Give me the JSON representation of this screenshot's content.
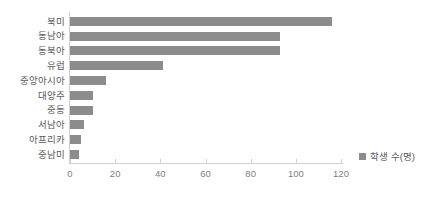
{
  "chart_data": {
    "type": "bar",
    "orientation": "horizontal",
    "title": "",
    "xlabel": "",
    "ylabel": "",
    "categories": [
      "북미",
      "동남아",
      "동북아",
      "유럽",
      "중앙아시아",
      "대양주",
      "중동",
      "서남아",
      "아프리카",
      "중남미"
    ],
    "series": [
      {
        "name": "학생 수(명)",
        "values": [
          116,
          93,
          93,
          41,
          16,
          10,
          10,
          6,
          5,
          4
        ],
        "color": "#8c8c8c"
      }
    ],
    "xlim": [
      0,
      120
    ],
    "xticks": [
      0,
      20,
      40,
      60,
      80,
      100,
      120
    ],
    "xtick_labels": [
      "0",
      "20",
      "40",
      "60",
      "80",
      "100",
      "120"
    ],
    "grid": false,
    "legend": {
      "position": "bottom-right",
      "entries": [
        "학생 수(명)"
      ]
    }
  },
  "legend": {
    "label": "학생 수(명)",
    "swatch_color": "#8c8c8c"
  },
  "axis": {
    "line_color": "#d0d0d0",
    "tick_color": "#808080"
  }
}
